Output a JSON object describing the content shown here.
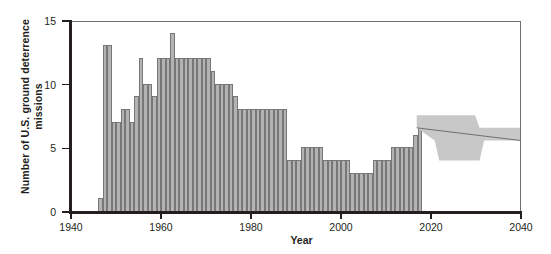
{
  "chart_data": {
    "type": "bar",
    "title": "",
    "xlabel": "Year",
    "ylabel": "Number of U.S. ground deterrence missions",
    "xlim": [
      1940,
      2040
    ],
    "ylim": [
      0,
      15
    ],
    "xticks": [
      1940,
      1960,
      1980,
      2000,
      2020,
      2040
    ],
    "yticks": [
      0,
      5,
      10,
      15
    ],
    "grid": false,
    "legend": "none",
    "bar_color": "#b3b3b3",
    "bar_edge_color": "#777777",
    "band_color": "#c8c8c8",
    "axis_color": "#231f20",
    "bar_width_years": 1,
    "categories": [
      1946,
      1947,
      1948,
      1949,
      1950,
      1951,
      1952,
      1953,
      1954,
      1955,
      1956,
      1957,
      1958,
      1959,
      1960,
      1961,
      1962,
      1963,
      1964,
      1965,
      1966,
      1967,
      1968,
      1969,
      1970,
      1971,
      1972,
      1973,
      1974,
      1975,
      1976,
      1977,
      1978,
      1979,
      1980,
      1981,
      1982,
      1983,
      1984,
      1985,
      1986,
      1987,
      1988,
      1989,
      1990,
      1991,
      1992,
      1993,
      1994,
      1995,
      1996,
      1997,
      1998,
      1999,
      2000,
      2001,
      2002,
      2003,
      2004,
      2005,
      2006,
      2007,
      2008,
      2009,
      2010,
      2011,
      2012,
      2013,
      2014,
      2015,
      2016,
      2017
    ],
    "values": [
      1,
      13,
      13,
      7,
      7,
      8,
      8,
      7,
      9,
      12,
      10,
      10,
      9,
      12,
      12,
      12,
      14,
      12,
      12,
      12,
      12,
      12,
      12,
      12,
      12,
      11,
      10,
      10,
      10,
      10,
      9,
      8,
      8,
      8,
      8,
      8,
      8,
      8,
      8,
      8,
      8,
      8,
      4,
      4,
      4,
      5,
      5,
      5,
      5,
      5,
      4,
      4,
      4,
      4,
      4,
      4,
      3,
      3,
      3,
      3,
      3,
      4,
      4,
      4,
      4,
      5,
      5,
      5,
      5,
      5,
      6,
      7
    ],
    "projection": {
      "label": "",
      "x_start": 2017,
      "x_end": 2040,
      "upper": [
        {
          "x": 2017,
          "y": 7.6
        },
        {
          "x": 2030,
          "y": 7.6
        },
        {
          "x": 2031,
          "y": 6.6
        },
        {
          "x": 2040,
          "y": 6.6
        }
      ],
      "lower": [
        {
          "x": 2017,
          "y": 6.6
        },
        {
          "x": 2021,
          "y": 5.6
        },
        {
          "x": 2022,
          "y": 4.0
        },
        {
          "x": 2031,
          "y": 4.0
        },
        {
          "x": 2032,
          "y": 5.6
        },
        {
          "x": 2040,
          "y": 5.6
        }
      ],
      "center_line": [
        {
          "x": 2017,
          "y": 6.6
        },
        {
          "x": 2040,
          "y": 5.6
        }
      ]
    }
  }
}
